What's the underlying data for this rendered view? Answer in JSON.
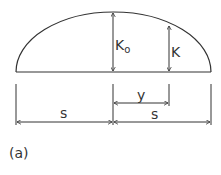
{
  "figure": {
    "caption": "(a)",
    "line_color": "#333333",
    "background": "#ffffff"
  },
  "labels": {
    "k0_main": "K",
    "k0_sub": "o",
    "k": "K",
    "y": "y",
    "s_left": "s",
    "s_right": "s"
  },
  "geometry": {
    "baseline": {
      "x1": 16,
      "x2": 211,
      "y": 72
    },
    "arc_apex": {
      "x": 113,
      "y": 12
    },
    "k0_line": {
      "x": 113,
      "y_top": 12,
      "y_bottom": 72
    },
    "k_line": {
      "x": 169,
      "y_top": 25,
      "y_bottom": 72
    },
    "y_dimension": {
      "x1": 113,
      "x2": 169,
      "y": 103
    },
    "s_dimension": {
      "x_left": 16,
      "x_mid": 113,
      "x_right": 211,
      "y": 122
    }
  }
}
